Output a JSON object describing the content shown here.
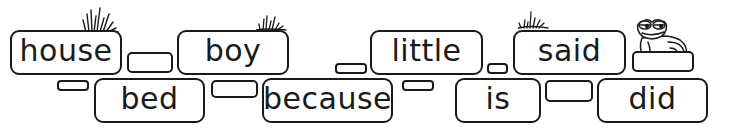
{
  "activity": {
    "type": "word-wall",
    "top_row_words": [
      {
        "label": "house"
      },
      {
        "label": "boy"
      },
      {
        "label": "little"
      },
      {
        "label": "said"
      }
    ],
    "bottom_row_words": [
      {
        "label": "bed"
      },
      {
        "label": "because"
      },
      {
        "label": "is"
      },
      {
        "label": "did"
      }
    ]
  },
  "decorations": {
    "grass_tufts": [
      "grass-icon",
      "grass-icon",
      "grass-icon"
    ],
    "mascot": "frog-icon"
  },
  "colors": {
    "ink": "#1a1a1a",
    "background": "#ffffff"
  }
}
